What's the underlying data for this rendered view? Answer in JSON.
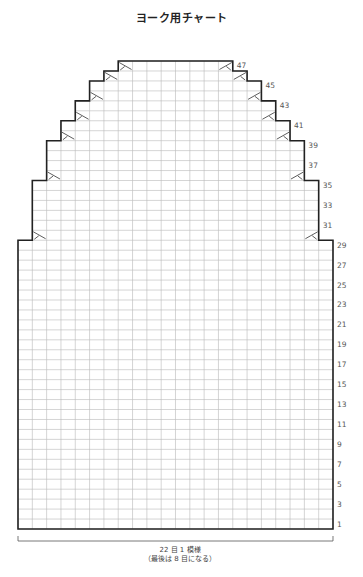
{
  "title": "ヨーク用チャート",
  "chart": {
    "columns": 22,
    "rows": 47,
    "origin": {
      "x": 18,
      "y": 529
    },
    "cell_width": 14.318,
    "cell_height": 9.957,
    "grid_color": "#b8b8b8",
    "outline_color": "#222222",
    "row_labels": [
      "1",
      "3",
      "5",
      "7",
      "9",
      "11",
      "13",
      "15",
      "17",
      "19",
      "21",
      "23",
      "25",
      "27",
      "29",
      "31",
      "33",
      "35",
      "37",
      "39",
      "41",
      "43",
      "45",
      "47"
    ],
    "left_outline": [
      {
        "col": 0,
        "rows": [
          1,
          29
        ]
      },
      {
        "col": 1,
        "rows": [
          30,
          35
        ]
      },
      {
        "col": 2,
        "rows": [
          36,
          39
        ]
      },
      {
        "col": 3,
        "rows": [
          40,
          41
        ]
      },
      {
        "col": 4,
        "rows": [
          42,
          43
        ]
      },
      {
        "col": 5,
        "rows": [
          44,
          45
        ]
      },
      {
        "col": 6,
        "rows": [
          46,
          46
        ]
      },
      {
        "col": 7,
        "rows": [
          47,
          47
        ]
      }
    ],
    "decrease_marks": [
      {
        "row": 30,
        "left_col": 1,
        "right_col": 20
      },
      {
        "row": 36,
        "left_col": 2,
        "right_col": 19
      },
      {
        "row": 40,
        "left_col": 3,
        "right_col": 18
      },
      {
        "row": 42,
        "left_col": 4,
        "right_col": 17
      },
      {
        "row": 44,
        "left_col": 5,
        "right_col": 16
      },
      {
        "row": 46,
        "left_col": 6,
        "right_col": 15
      },
      {
        "row": 47,
        "left_col": 7,
        "right_col": 14
      }
    ]
  },
  "footer": {
    "repeat_label": "22 目 1 模様",
    "note": "（最後は 8 目になる）"
  }
}
